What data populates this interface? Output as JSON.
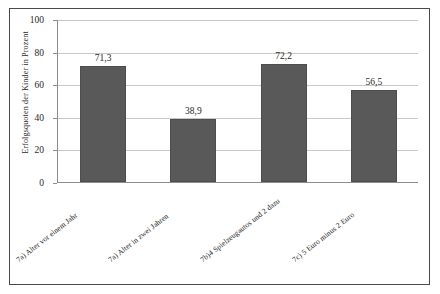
{
  "chart_data": {
    "type": "bar",
    "title": "",
    "xlabel": "",
    "ylabel": "Erfolgsquoten der Kinder in Prozent",
    "ylim": [
      0,
      100
    ],
    "yticks": [
      0,
      20,
      40,
      60,
      80,
      100
    ],
    "ytick_labels": [
      "0",
      "20",
      "40",
      "60",
      "80",
      "100"
    ],
    "grid": true,
    "legend": "none",
    "bar_color": "#595959",
    "categories": [
      "7a) Alter vor einem Jahr",
      "7a) Alter in zwei Jahren",
      "7b)4 Spielzeugautos und 2 dazu",
      "7c) 5 Euro minus 2 Euro"
    ],
    "values": [
      71.3,
      38.9,
      72.2,
      56.5
    ],
    "data_labels": [
      "71,3",
      "38,9",
      "72,2",
      "56,5"
    ]
  },
  "axes": {
    "y_title": "Erfolgsquoten der Kinder in Prozent"
  }
}
